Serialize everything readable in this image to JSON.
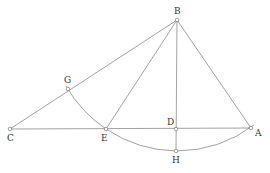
{
  "diagram": {
    "type": "geometric-construction",
    "colors": {
      "line": "#8a8a8a",
      "point": "#777777",
      "label": "#333333",
      "background": "#ffffff"
    },
    "points": {
      "B": {
        "label": "B",
        "x": 177,
        "y": 20
      },
      "C": {
        "label": "C",
        "x": 10,
        "y": 129
      },
      "G": {
        "label": "G",
        "x": 68,
        "y": 89
      },
      "E": {
        "label": "E",
        "x": 106,
        "y": 129
      },
      "D": {
        "label": "D",
        "x": 176,
        "y": 129
      },
      "A": {
        "label": "A",
        "x": 251,
        "y": 128
      },
      "H": {
        "label": "H",
        "x": 176,
        "y": 151
      }
    },
    "segments": [
      "CB",
      "CA",
      "BE",
      "BD",
      "DH",
      "BA"
    ],
    "arcs": [
      {
        "name": "arc-GEHA",
        "center": "B",
        "through": [
          "G",
          "E",
          "H",
          "A"
        ]
      }
    ]
  }
}
